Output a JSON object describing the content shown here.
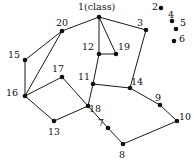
{
  "figure": {
    "type": "node-link-graph",
    "background_color": "#ffffff",
    "node_color": "#111111",
    "edge_color": "#1a1a1a",
    "width": 194,
    "height": 162
  },
  "nodes": [
    {
      "id": "1",
      "label": "1(class)",
      "x": 99,
      "y": 17,
      "label_x": 78,
      "label_y": 2,
      "isolated": false
    },
    {
      "id": "2",
      "label": "2",
      "x": 161,
      "y": 8,
      "label_x": 152,
      "label_y": 2,
      "isolated": true
    },
    {
      "id": "3",
      "label": "3",
      "x": 146,
      "y": 30,
      "label_x": 137,
      "label_y": 18,
      "isolated": false
    },
    {
      "id": "4",
      "label": "4",
      "x": 172,
      "y": 21,
      "label_x": 168,
      "label_y": 10,
      "isolated": true
    },
    {
      "id": "5",
      "label": "5",
      "x": 176,
      "y": 29,
      "label_x": 180,
      "label_y": 18,
      "isolated": true
    },
    {
      "id": "6",
      "label": "6",
      "x": 174,
      "y": 41,
      "label_x": 179,
      "label_y": 34,
      "isolated": true
    },
    {
      "id": "7",
      "label": "7",
      "x": 108,
      "y": 128,
      "label_x": 98,
      "label_y": 118,
      "isolated": false
    },
    {
      "id": "8",
      "label": "8",
      "x": 123,
      "y": 144,
      "label_x": 119,
      "label_y": 150,
      "isolated": false
    },
    {
      "id": "9",
      "label": "9",
      "x": 160,
      "y": 105,
      "label_x": 155,
      "label_y": 93,
      "isolated": false
    },
    {
      "id": "10",
      "label": "10",
      "x": 177,
      "y": 121,
      "label_x": 179,
      "label_y": 112,
      "isolated": false
    },
    {
      "id": "11",
      "label": "11",
      "x": 93,
      "y": 84,
      "label_x": 78,
      "label_y": 72,
      "isolated": false
    },
    {
      "id": "12",
      "label": "12",
      "x": 99,
      "y": 54,
      "label_x": 82,
      "label_y": 42,
      "isolated": false
    },
    {
      "id": "13",
      "label": "13",
      "x": 54,
      "y": 121,
      "label_x": 48,
      "label_y": 127,
      "isolated": false
    },
    {
      "id": "14",
      "label": "14",
      "x": 130,
      "y": 88,
      "label_x": 131,
      "label_y": 77,
      "isolated": false
    },
    {
      "id": "15",
      "label": "15",
      "x": 25,
      "y": 60,
      "label_x": 8,
      "label_y": 50,
      "isolated": false
    },
    {
      "id": "16",
      "label": "16",
      "x": 25,
      "y": 96,
      "label_x": 6,
      "label_y": 88,
      "isolated": false
    },
    {
      "id": "17",
      "label": "17",
      "x": 62,
      "y": 77,
      "label_x": 52,
      "label_y": 64,
      "isolated": false
    },
    {
      "id": "18",
      "label": "18",
      "x": 88,
      "y": 106,
      "label_x": 89,
      "label_y": 104,
      "isolated": false
    },
    {
      "id": "19",
      "label": "19",
      "x": 116,
      "y": 54,
      "label_x": 118,
      "label_y": 42,
      "isolated": false
    },
    {
      "id": "20",
      "label": "20",
      "x": 62,
      "y": 31,
      "label_x": 56,
      "label_y": 18,
      "isolated": false
    }
  ],
  "edges": [
    {
      "from": "1",
      "to": "20"
    },
    {
      "from": "1",
      "to": "3"
    },
    {
      "from": "1",
      "to": "12"
    },
    {
      "from": "1",
      "to": "19"
    },
    {
      "from": "12",
      "to": "19"
    },
    {
      "from": "12",
      "to": "11"
    },
    {
      "from": "3",
      "to": "14"
    },
    {
      "from": "20",
      "to": "15"
    },
    {
      "from": "20",
      "to": "16"
    },
    {
      "from": "15",
      "to": "16"
    },
    {
      "from": "16",
      "to": "17"
    },
    {
      "from": "16",
      "to": "13"
    },
    {
      "from": "17",
      "to": "18"
    },
    {
      "from": "13",
      "to": "18"
    },
    {
      "from": "11",
      "to": "18"
    },
    {
      "from": "11",
      "to": "14"
    },
    {
      "from": "18",
      "to": "7"
    },
    {
      "from": "14",
      "to": "9"
    },
    {
      "from": "9",
      "to": "10"
    },
    {
      "from": "7",
      "to": "8"
    },
    {
      "from": "8",
      "to": "10"
    }
  ]
}
